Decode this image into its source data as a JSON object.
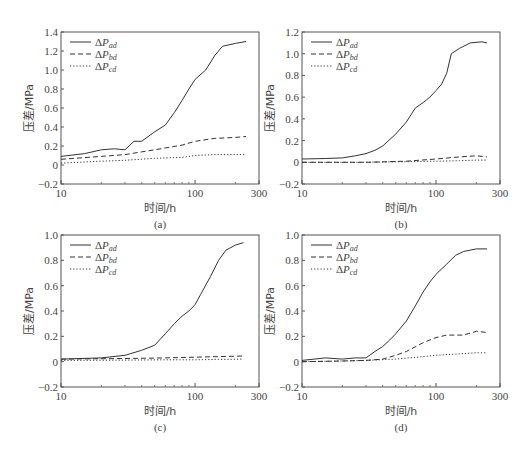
{
  "chart_data": [
    {
      "type": "line",
      "panel": "(a)",
      "xlabel": "时间/h",
      "ylabel": "压差/MPa",
      "xscale": "log",
      "xlim": [
        10,
        300
      ],
      "ylim": [
        -0.2,
        1.4
      ],
      "xticks": [
        "10",
        "100",
        "300"
      ],
      "yticks": [
        "-0.2",
        "0",
        "0.2",
        "0.4",
        "0.6",
        "0.8",
        "1.0",
        "1.2",
        "1.4"
      ],
      "legend": [
        "ΔPad",
        "ΔPbd",
        "ΔPcd"
      ],
      "series": [
        {
          "name": "ΔPad",
          "style": "solid",
          "x": [
            10,
            15,
            20,
            25,
            30,
            35,
            40,
            50,
            60,
            70,
            80,
            90,
            100,
            120,
            140,
            160,
            200,
            240
          ],
          "y": [
            0.09,
            0.12,
            0.16,
            0.17,
            0.16,
            0.25,
            0.25,
            0.35,
            0.42,
            0.55,
            0.68,
            0.8,
            0.9,
            1.0,
            1.15,
            1.25,
            1.28,
            1.3
          ]
        },
        {
          "name": "ΔPbd",
          "style": "dashed",
          "x": [
            10,
            20,
            30,
            50,
            80,
            100,
            140,
            200,
            240
          ],
          "y": [
            0.06,
            0.09,
            0.11,
            0.16,
            0.21,
            0.25,
            0.28,
            0.29,
            0.3
          ]
        },
        {
          "name": "ΔPcd",
          "style": "dotted",
          "x": [
            10,
            20,
            30,
            50,
            80,
            100,
            140,
            200,
            240
          ],
          "y": [
            0.02,
            0.04,
            0.05,
            0.07,
            0.08,
            0.1,
            0.11,
            0.11,
            0.11
          ]
        }
      ]
    },
    {
      "type": "line",
      "panel": "(b)",
      "xlabel": "时间/h",
      "ylabel": "压差/MPa",
      "xscale": "log",
      "xlim": [
        10,
        300
      ],
      "ylim": [
        -0.2,
        1.2
      ],
      "xticks": [
        "10",
        "100",
        "300"
      ],
      "yticks": [
        "-0.2",
        "0",
        "0.2",
        "0.4",
        "0.6",
        "0.8",
        "1.0",
        "1.2"
      ],
      "legend": [
        "ΔPad",
        "ΔPbd",
        "ΔPcd"
      ],
      "series": [
        {
          "name": "ΔPad",
          "style": "solid",
          "x": [
            10,
            15,
            20,
            25,
            30,
            35,
            40,
            50,
            60,
            70,
            80,
            90,
            100,
            110,
            120,
            130,
            150,
            180,
            220,
            240
          ],
          "y": [
            0.03,
            0.035,
            0.04,
            0.06,
            0.08,
            0.11,
            0.15,
            0.26,
            0.37,
            0.5,
            0.55,
            0.6,
            0.66,
            0.72,
            0.82,
            1.0,
            1.05,
            1.1,
            1.11,
            1.1
          ]
        },
        {
          "name": "ΔPbd",
          "style": "dashed",
          "x": [
            10,
            30,
            60,
            100,
            150,
            200,
            240
          ],
          "y": [
            0.0,
            0.0,
            0.01,
            0.03,
            0.05,
            0.06,
            0.05
          ]
        },
        {
          "name": "ΔPcd",
          "style": "dotted",
          "x": [
            10,
            30,
            60,
            100,
            150,
            200,
            240
          ],
          "y": [
            0.0,
            0.0,
            0.005,
            0.01,
            0.015,
            0.02,
            0.02
          ]
        }
      ]
    },
    {
      "type": "line",
      "panel": "(c)",
      "xlabel": "时间/h",
      "ylabel": "压差/MPa",
      "xscale": "log",
      "xlim": [
        10,
        300
      ],
      "ylim": [
        -0.2,
        1.0
      ],
      "xticks": [
        "10",
        "100",
        "300"
      ],
      "yticks": [
        "-0.2",
        "0",
        "0.2",
        "0.4",
        "0.6",
        "0.8",
        "1.0"
      ],
      "legend": [
        "ΔPad",
        "ΔPbd",
        "ΔPcd"
      ],
      "series": [
        {
          "name": "ΔPad",
          "style": "solid",
          "x": [
            10,
            20,
            30,
            40,
            50,
            60,
            70,
            80,
            90,
            100,
            110,
            130,
            150,
            170,
            200,
            230
          ],
          "y": [
            0.02,
            0.03,
            0.05,
            0.09,
            0.13,
            0.22,
            0.3,
            0.36,
            0.4,
            0.45,
            0.53,
            0.67,
            0.8,
            0.88,
            0.92,
            0.94
          ]
        },
        {
          "name": "ΔPbd",
          "style": "dashed",
          "x": [
            10,
            30,
            60,
            100,
            150,
            230
          ],
          "y": [
            0.02,
            0.025,
            0.03,
            0.035,
            0.04,
            0.045
          ]
        },
        {
          "name": "ΔPcd",
          "style": "dotted",
          "x": [
            10,
            30,
            60,
            100,
            150,
            230
          ],
          "y": [
            0.01,
            0.012,
            0.015,
            0.015,
            0.018,
            0.02
          ]
        }
      ]
    },
    {
      "type": "line",
      "panel": "(d)",
      "xlabel": "时间/h",
      "ylabel": "压差/MPa",
      "xscale": "log",
      "xlim": [
        10,
        300
      ],
      "ylim": [
        -0.2,
        1.0
      ],
      "xticks": [
        "10",
        "100",
        "300"
      ],
      "yticks": [
        "-0.2",
        "0",
        "0.2",
        "0.4",
        "0.6",
        "0.8",
        "1.0"
      ],
      "legend": [
        "ΔPad",
        "ΔPbd",
        "ΔPcd"
      ],
      "series": [
        {
          "name": "ΔPad",
          "style": "solid",
          "x": [
            10,
            15,
            20,
            25,
            30,
            35,
            40,
            45,
            50,
            60,
            70,
            80,
            90,
            100,
            120,
            140,
            160,
            200,
            240
          ],
          "y": [
            0.01,
            0.03,
            0.02,
            0.03,
            0.03,
            0.08,
            0.12,
            0.17,
            0.22,
            0.32,
            0.44,
            0.55,
            0.63,
            0.69,
            0.77,
            0.84,
            0.87,
            0.89,
            0.89
          ]
        },
        {
          "name": "ΔPbd",
          "style": "dashed",
          "x": [
            10,
            20,
            30,
            40,
            50,
            60,
            80,
            100,
            120,
            160,
            200,
            240
          ],
          "y": [
            0.0,
            0.005,
            0.01,
            0.02,
            0.05,
            0.08,
            0.15,
            0.19,
            0.21,
            0.21,
            0.24,
            0.23
          ]
        },
        {
          "name": "ΔPcd",
          "style": "dotted",
          "x": [
            10,
            20,
            30,
            50,
            80,
            100,
            140,
            200,
            240
          ],
          "y": [
            0.0,
            0.005,
            0.01,
            0.02,
            0.04,
            0.05,
            0.06,
            0.07,
            0.07
          ]
        }
      ]
    }
  ]
}
